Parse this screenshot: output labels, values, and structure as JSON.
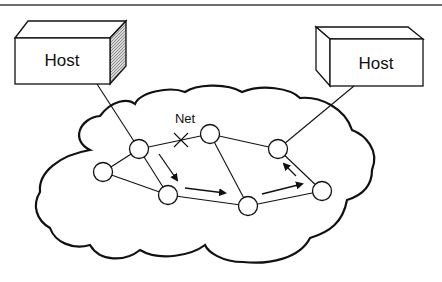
{
  "figure": {
    "hosts": [
      {
        "id": "host-left",
        "label": "Host"
      },
      {
        "id": "host-right",
        "label": "Host"
      }
    ],
    "network_label": "Net",
    "broken_link_marker": "X",
    "nodes": [
      {
        "id": "A",
        "x": 139,
        "y": 149
      },
      {
        "id": "B",
        "x": 103,
        "y": 172
      },
      {
        "id": "C",
        "x": 168,
        "y": 195
      },
      {
        "id": "D",
        "x": 210,
        "y": 134
      },
      {
        "id": "E",
        "x": 248,
        "y": 206
      },
      {
        "id": "F",
        "x": 278,
        "y": 149
      },
      {
        "id": "G",
        "x": 322,
        "y": 191
      }
    ],
    "links": [
      [
        "A",
        "B"
      ],
      [
        "A",
        "C"
      ],
      [
        "A",
        "D"
      ],
      [
        "B",
        "C"
      ],
      [
        "C",
        "E"
      ],
      [
        "D",
        "E"
      ],
      [
        "D",
        "F"
      ],
      [
        "E",
        "G"
      ],
      [
        "F",
        "G"
      ]
    ],
    "route_arrows": [
      "A→C",
      "C→E",
      "E→G",
      "G→F"
    ],
    "colors": {
      "stroke": "#111111",
      "host_side_shade": "#9a9a9a",
      "rule": "#6e6e6e"
    }
  }
}
